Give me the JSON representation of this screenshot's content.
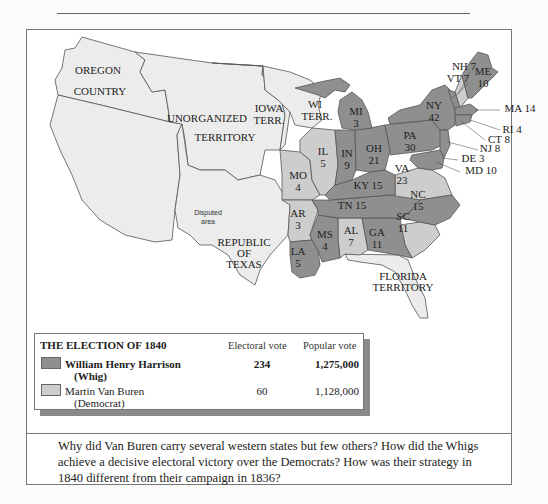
{
  "map": {
    "territory_labels": [
      {
        "id": "oregon",
        "lines": [
          "OREGON",
          "COUNTRY"
        ]
      },
      {
        "id": "unorganized",
        "lines": [
          "UNORGANIZED",
          "TERRITORY"
        ]
      },
      {
        "id": "iowa",
        "lines": [
          "IOWA",
          "TERR."
        ]
      },
      {
        "id": "wisconsin",
        "lines": [
          "WI",
          "TERR."
        ]
      },
      {
        "id": "texas",
        "lines": [
          "REPUBLIC",
          "OF",
          "TEXAS"
        ]
      },
      {
        "id": "disputed",
        "lines": [
          "Disputed",
          "area"
        ]
      },
      {
        "id": "florida",
        "lines": [
          "FLORIDA",
          "TERRITORY"
        ]
      }
    ],
    "states": [
      {
        "abbr": "ME",
        "ev": 10,
        "winner": "Whig"
      },
      {
        "abbr": "NH",
        "ev": 7,
        "winner": "Democrat"
      },
      {
        "abbr": "VT",
        "ev": 7,
        "winner": "Whig"
      },
      {
        "abbr": "MA",
        "ev": 14,
        "winner": "Whig"
      },
      {
        "abbr": "RI",
        "ev": 4,
        "winner": "Whig"
      },
      {
        "abbr": "CT",
        "ev": 8,
        "winner": "Whig"
      },
      {
        "abbr": "NY",
        "ev": 42,
        "winner": "Whig"
      },
      {
        "abbr": "NJ",
        "ev": 8,
        "winner": "Whig"
      },
      {
        "abbr": "PA",
        "ev": 30,
        "winner": "Whig"
      },
      {
        "abbr": "DE",
        "ev": 3,
        "winner": "Whig"
      },
      {
        "abbr": "MD",
        "ev": 10,
        "winner": "Whig"
      },
      {
        "abbr": "VA",
        "ev": 23,
        "winner": "Democrat"
      },
      {
        "abbr": "NC",
        "ev": 15,
        "winner": "Whig"
      },
      {
        "abbr": "SC",
        "ev": 11,
        "winner": "Democrat"
      },
      {
        "abbr": "GA",
        "ev": 11,
        "winner": "Whig"
      },
      {
        "abbr": "AL",
        "ev": 7,
        "winner": "Democrat"
      },
      {
        "abbr": "MS",
        "ev": 4,
        "winner": "Whig"
      },
      {
        "abbr": "LA",
        "ev": 5,
        "winner": "Whig"
      },
      {
        "abbr": "TN",
        "ev": 15,
        "winner": "Whig"
      },
      {
        "abbr": "KY",
        "ev": 15,
        "winner": "Whig"
      },
      {
        "abbr": "OH",
        "ev": 21,
        "winner": "Whig"
      },
      {
        "abbr": "IN",
        "ev": 9,
        "winner": "Whig"
      },
      {
        "abbr": "IL",
        "ev": 5,
        "winner": "Democrat"
      },
      {
        "abbr": "MI",
        "ev": 3,
        "winner": "Whig"
      },
      {
        "abbr": "MO",
        "ev": 4,
        "winner": "Democrat"
      },
      {
        "abbr": "AR",
        "ev": 3,
        "winner": "Democrat"
      }
    ],
    "labels": {
      "ME": [
        "ME",
        "10"
      ],
      "NH": "NH 7",
      "VT": "VT 7",
      "MA": "MA 14",
      "RI": "RI 4",
      "CT": "CT 8",
      "NY": [
        "NY",
        "42"
      ],
      "NJ": "NJ 8",
      "PA": [
        "PA",
        "30"
      ],
      "DE": "DE 3",
      "MD": "MD 10",
      "VA": [
        "VA",
        "23"
      ],
      "NC": [
        "NC",
        "15"
      ],
      "SC": [
        "SC",
        "11"
      ],
      "GA": [
        "GA",
        "11"
      ],
      "AL": [
        "AL",
        "7"
      ],
      "MS": [
        "MS",
        "4"
      ],
      "LA": [
        "LA",
        "5"
      ],
      "TN": "TN 15",
      "KY": "KY 15",
      "OH": [
        "OH",
        "21"
      ],
      "IN": [
        "IN",
        "9"
      ],
      "IL": [
        "IL",
        "5"
      ],
      "MI": [
        "MI",
        "3"
      ],
      "MO": [
        "MO",
        "4"
      ],
      "AR": [
        "AR",
        "3"
      ]
    }
  },
  "colors": {
    "whig": "#8f8f8f",
    "democrat": "#cdcdcd",
    "territory": "#ececec",
    "water": "#ffffff",
    "border": "#555555"
  },
  "legend": {
    "title": "THE ELECTION OF 1840",
    "col_electoral": "Electoral vote",
    "col_popular": "Popular vote",
    "rows": [
      {
        "name": "William Henry Harrison",
        "party": "(Whig)",
        "electoral": "234",
        "popular": "1,275,000"
      },
      {
        "name": "Martin Van Buren",
        "party": "(Democrat)",
        "electoral": "60",
        "popular": "1,128,000"
      }
    ]
  },
  "caption": "Why did Van Buren carry several western states but few others? How did the Whigs achieve a decisive electoral victory over the Democrats? How was their strategy in 1840 different from their campaign in 1836?"
}
